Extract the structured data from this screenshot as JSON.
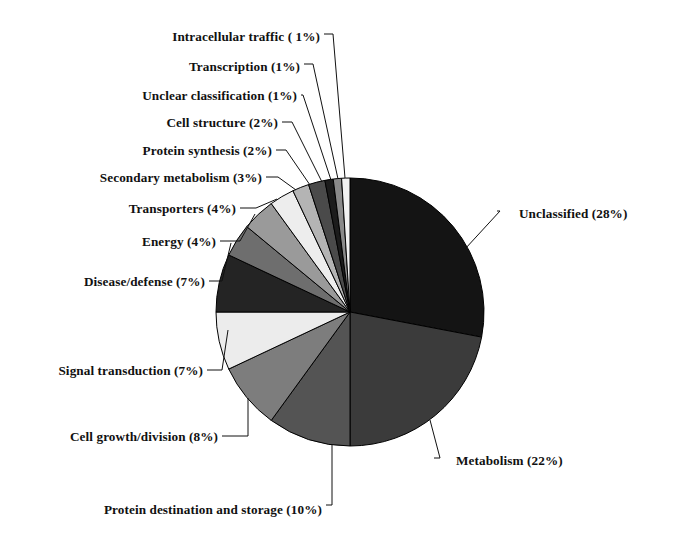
{
  "figure": {
    "title": "",
    "background": "#ffffff",
    "text_color": "#111111"
  },
  "chart_data": {
    "type": "pie",
    "title": "",
    "xlabel": "",
    "ylabel": "",
    "legend_position": "none",
    "grid": false,
    "units": "percent",
    "total": 100,
    "start_angle_deg": 0,
    "direction": "clockwise",
    "center": {
      "x": 350,
      "y": 312
    },
    "radius": 134,
    "categories": [
      "Unclassified",
      "Metabolism",
      "Protein destination and storage",
      "Cell growth/division",
      "Signal transduction",
      "Disease/defense",
      "Energy",
      "Transporters",
      "Secondary metabolism",
      "Protein synthesis",
      "Cell structure",
      "Unclear classification",
      "Transcription",
      "Intracellular traffic"
    ],
    "values": [
      28,
      22,
      10,
      8,
      7,
      7,
      4,
      4,
      3,
      2,
      2,
      1,
      1,
      1
    ],
    "colors": [
      "#141414",
      "#3b3b3b",
      "#545454",
      "#7d7d7d",
      "#ececec",
      "#242424",
      "#6e6e6e",
      "#9a9a9a",
      "#ededed",
      "#b4b4b4",
      "#4a4a4a",
      "#1c1c1c",
      "#8a8a8a",
      "#f2f2f2"
    ],
    "slice_edge_color": "#000000",
    "labels": [
      {
        "text": "Unclassified (28%)",
        "value": 28,
        "side": "right"
      },
      {
        "text": "Metabolism (22%)",
        "value": 22,
        "side": "right"
      },
      {
        "text": "Protein destination and storage (10%)",
        "value": 10,
        "side": "left"
      },
      {
        "text": "Cell growth/division (8%)",
        "value": 8,
        "side": "left"
      },
      {
        "text": "Signal transduction (7%)",
        "value": 7,
        "side": "left"
      },
      {
        "text": "Disease/defense (7%)",
        "value": 7,
        "side": "left"
      },
      {
        "text": "Energy (4%)",
        "value": 4,
        "side": "left"
      },
      {
        "text": "Transporters (4%)",
        "value": 4,
        "side": "left"
      },
      {
        "text": "Secondary metabolism (3%)",
        "value": 3,
        "side": "left"
      },
      {
        "text": "Protein synthesis (2%)",
        "value": 2,
        "side": "left"
      },
      {
        "text": "Cell structure (2%)",
        "value": 2,
        "side": "left"
      },
      {
        "text": "Unclear classification (1%)",
        "value": 1,
        "side": "left"
      },
      {
        "text": "Transcription (1%)",
        "value": 1,
        "side": "left"
      },
      {
        "text": "Intracellular traffic ( 1%)",
        "value": 1,
        "side": "left"
      }
    ]
  },
  "label_layout": [
    {
      "key": "intracellular-traffic",
      "text": "Intracellular traffic ( 1%)",
      "x_right": 320,
      "y": 38,
      "side": "left",
      "anchor_x": 345,
      "anchor_y": 178,
      "elbow_x": 333,
      "elbow_y": 34
    },
    {
      "key": "transcription",
      "text": "Transcription (1%)",
      "x_right": 300,
      "y": 68,
      "side": "left",
      "anchor_x": 338,
      "anchor_y": 179,
      "elbow_x": 313,
      "elbow_y": 64
    },
    {
      "key": "unclear-classification",
      "text": "Unclear classification (1%)",
      "x_right": 297,
      "y": 97,
      "side": "left",
      "anchor_x": 331,
      "anchor_y": 180,
      "elbow_x": 303,
      "elbow_y": 95
    },
    {
      "key": "cell-structure",
      "text": "Cell structure (2%)",
      "x_right": 278,
      "y": 124,
      "side": "left",
      "anchor_x": 322,
      "anchor_y": 182,
      "elbow_x": 292,
      "elbow_y": 122
    },
    {
      "key": "protein-synthesis",
      "text": "Protein synthesis (2%)",
      "x_right": 272,
      "y": 152,
      "side": "left",
      "anchor_x": 310,
      "anchor_y": 185,
      "elbow_x": 286,
      "elbow_y": 150
    },
    {
      "key": "secondary-metabolism",
      "text": "Secondary metabolism (3%)",
      "x_right": 262,
      "y": 179,
      "side": "left",
      "anchor_x": 296,
      "anchor_y": 190,
      "elbow_x": 278,
      "elbow_y": 177
    },
    {
      "key": "transporters",
      "text": "Transporters (4%)",
      "x_right": 236,
      "y": 210,
      "side": "left",
      "anchor_x": 277,
      "anchor_y": 199,
      "elbow_x": 256,
      "elbow_y": 208
    },
    {
      "key": "energy",
      "text": "Energy (4%)",
      "x_right": 216,
      "y": 243,
      "side": "left",
      "anchor_x": 255,
      "anchor_y": 214,
      "elbow_x": 240,
      "elbow_y": 241
    },
    {
      "key": "disease-defense",
      "text": "Disease/defense (7%)",
      "x_right": 205,
      "y": 283,
      "side": "left",
      "anchor_x": 231,
      "anchor_y": 243,
      "elbow_x": 222,
      "elbow_y": 281
    },
    {
      "key": "signal-transduction",
      "text": "Signal transduction (7%)",
      "x_right": 203,
      "y": 372,
      "side": "left",
      "anchor_x": 228,
      "anchor_y": 330,
      "elbow_x": 222,
      "elbow_y": 370
    },
    {
      "key": "cell-growth-division",
      "text": "Cell growth/division (8%)",
      "x_right": 218,
      "y": 438,
      "side": "left",
      "anchor_x": 248,
      "anchor_y": 398,
      "elbow_x": 248,
      "elbow_y": 436
    },
    {
      "key": "protein-destination",
      "text": "Protein destination and storage (10%)",
      "x_right": 322,
      "y": 511,
      "side": "left",
      "anchor_x": 332,
      "anchor_y": 445,
      "elbow_x": 332,
      "elbow_y": 505
    },
    {
      "key": "metabolism",
      "text": "Metabolism (22%)",
      "x_left": 456,
      "y": 462,
      "side": "right",
      "anchor_x": 430,
      "anchor_y": 420,
      "elbow_x": 440,
      "elbow_y": 458
    },
    {
      "key": "unclassified",
      "text": "Unclassified (28%)",
      "x_left": 519,
      "y": 215,
      "side": "right",
      "anchor_x": 465,
      "anchor_y": 249,
      "elbow_x": 500,
      "elbow_y": 211
    }
  ]
}
